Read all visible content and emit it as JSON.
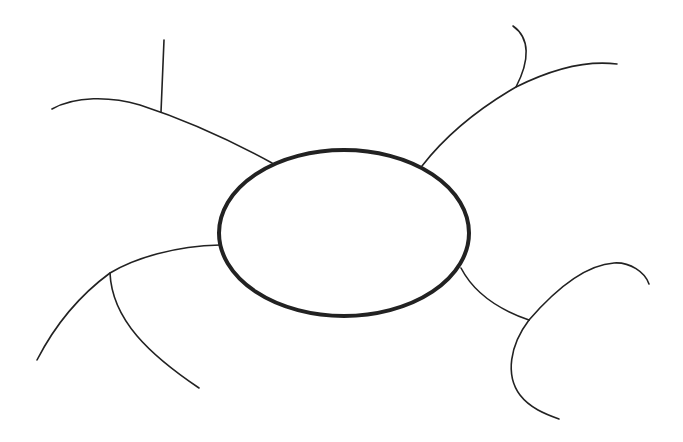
{
  "diagram": {
    "type": "mind-map-template",
    "background": "#ffffff",
    "stroke_color": "#222222",
    "center_node": {
      "shape": "ellipse",
      "cx": 344,
      "cy": 233,
      "rx": 125,
      "ry": 83,
      "stroke_width": 4,
      "label": ""
    },
    "branches": [
      {
        "name": "top-left",
        "path": "M272,163 C230,140 180,118 140,105 C110,96 75,96 52,109",
        "label": "",
        "sub_branches": [
          {
            "name": "top-left-stem",
            "path": "M161,112 L164,40",
            "label": ""
          }
        ]
      },
      {
        "name": "top-right",
        "path": "M422,166 C450,130 485,105 516,87 C550,70 585,60 617,64",
        "label": "",
        "sub_branches": [
          {
            "name": "top-right-hook",
            "path": "M516,87 C530,60 530,38 513,26",
            "label": ""
          }
        ]
      },
      {
        "name": "left",
        "path": "M220,245 C175,246 135,258 110,273 C80,295 55,325 37,360",
        "label": "",
        "sub_branches": [
          {
            "name": "left-sub",
            "path": "M110,273 C112,320 150,355 199,388",
            "label": ""
          }
        ]
      },
      {
        "name": "bottom-right",
        "path": "M461,268 C475,295 500,310 529,320",
        "label": "",
        "sub_branches": [
          {
            "name": "bottom-right-upper",
            "path": "M529,320 C555,290 585,265 614,263 C630,262 645,272 649,284",
            "label": ""
          },
          {
            "name": "bottom-right-lower",
            "path": "M529,320 C510,345 505,375 520,395 C530,408 545,414 559,419",
            "label": ""
          }
        ]
      }
    ]
  }
}
